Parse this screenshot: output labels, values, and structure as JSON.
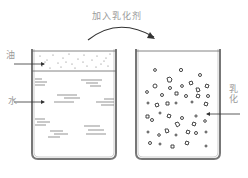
{
  "diagram": {
    "title_arrow_label": "加入乳化剂",
    "left_beaker": {
      "oil_label": "油",
      "water_label": "水"
    },
    "right_beaker": {
      "emulsion_label": "乳化"
    },
    "caption": "",
    "colors": {
      "line": "#555555",
      "label": "#9a9a9a",
      "vessel": "#777777"
    }
  }
}
